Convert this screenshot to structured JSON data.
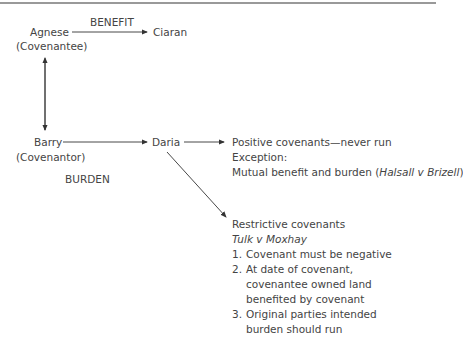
{
  "benefit_label": "BENEFIT",
  "burden_label": "BURDEN",
  "nodes": {
    "agnese": {
      "name": "Agnese",
      "role": "(Covenantee)"
    },
    "ciaran": {
      "name": "Ciaran"
    },
    "barry": {
      "name": "Barry",
      "role": "(Covenantor)"
    },
    "daria": {
      "name": "Daria"
    }
  },
  "positive": {
    "title": "Positive covenants—never run",
    "exception_label": "Exception:",
    "exception_text": "Mutual benefit and burden (",
    "exception_case": "Halsall v Brizell",
    "exception_close": ")"
  },
  "restrictive": {
    "title": "Restrictive covenants",
    "case": "Tulk v Moxhay",
    "conditions": [
      {
        "num": "1.",
        "text": "Covenant must be negative"
      },
      {
        "num": "2.",
        "text": "At date of covenant, covenantee owned land benefited by covenant"
      },
      {
        "num": "3.",
        "text": "Original parties intended burden should run"
      }
    ]
  }
}
